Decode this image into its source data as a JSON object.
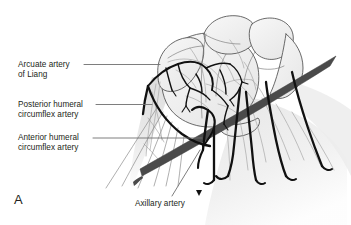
{
  "figure": {
    "panel_letter": "A",
    "background_color": "#ffffff",
    "width": 351,
    "height": 225
  },
  "palette": {
    "text": "#231f20",
    "leader_line": "#6f6f6f",
    "axillary_artery": "#4a4a4a",
    "branch_artery": "#111111",
    "bone_outline": "#4f4f4f",
    "bone_fill": "#f1f1f1",
    "muscle_fill": "#e8e8e8",
    "vessel_faint": "#9a9a9a"
  },
  "annotations": [
    {
      "id": "arcuate",
      "text": "Arcuate artery\nof Liang",
      "leader": {
        "type": "horizontal",
        "x1": 84,
        "y1": 64.5,
        "x2": 160,
        "y2": 64.5
      }
    },
    {
      "id": "posterior",
      "text": "Posterior humeral\ncircumflex artery",
      "leader": {
        "type": "horizontal",
        "x1": 96,
        "y1": 104.5,
        "x2": 152,
        "y2": 104.5
      }
    },
    {
      "id": "anterior",
      "text": "Anterior humeral\ncircumflex artery",
      "leader": {
        "type": "horizontal",
        "x1": 93,
        "y1": 138,
        "x2": 202,
        "y2": 138
      }
    },
    {
      "id": "axillary",
      "text": "Axillary artery",
      "leader": {
        "type": "diagonal",
        "x1": 172,
        "y1": 196,
        "x2": 200,
        "y2": 150
      }
    }
  ],
  "illustration": {
    "subject": "shoulder-arterial-anatomy",
    "structures": [
      "humeral head",
      "greater tuberosity",
      "lesser tuberosity",
      "deltoid muscle",
      "axillary artery",
      "anterior humeral circumflex artery",
      "posterior humeral circumflex artery",
      "arcuate artery of Liang",
      "descending arterial branches"
    ]
  }
}
